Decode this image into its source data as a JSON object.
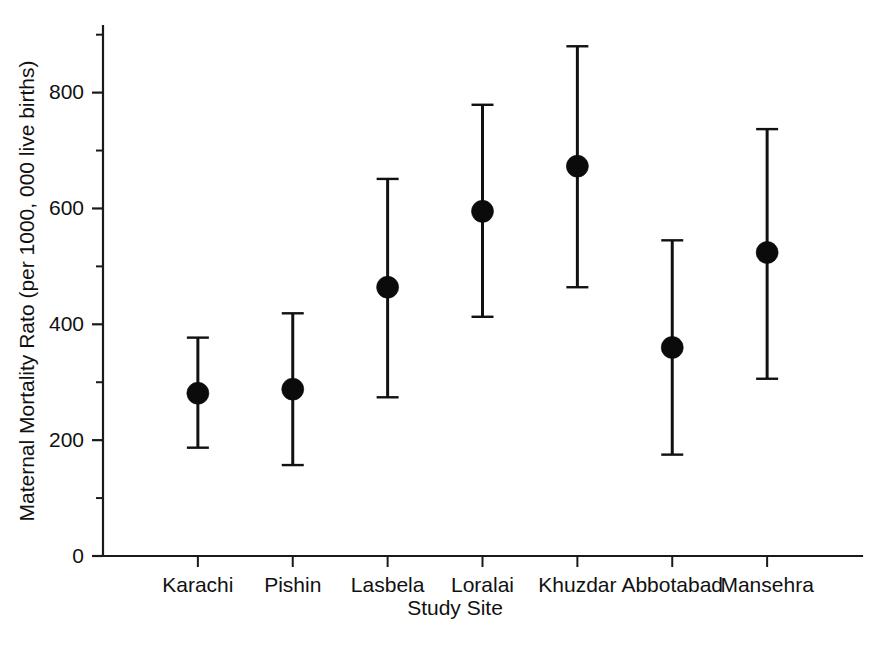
{
  "chart_data": {
    "type": "scatter",
    "title": "",
    "xlabel": "Study Site",
    "ylabel": "Maternal Mortality Rato (per 1000, 000 live births)",
    "categories": [
      "Karachi",
      "Pishin",
      "Lasbela",
      "Loralai",
      "Khuzdar",
      "Abbotabad",
      "Mansehra"
    ],
    "values": [
      281,
      288,
      464,
      595,
      673,
      360,
      524
    ],
    "error_low": [
      187,
      157,
      274,
      413,
      464,
      175,
      306
    ],
    "error_high": [
      377,
      419,
      651,
      779,
      880,
      545,
      737
    ],
    "series": [
      {
        "name": "Maternal Mortality Ratio",
        "points": [
          {
            "category": "Karachi",
            "value": 281,
            "lower": 187,
            "upper": 377
          },
          {
            "category": "Pishin",
            "value": 288,
            "lower": 157,
            "upper": 419
          },
          {
            "category": "Lasbela",
            "value": 464,
            "lower": 274,
            "upper": 651
          },
          {
            "category": "Loralai",
            "value": 595,
            "lower": 413,
            "upper": 779
          },
          {
            "category": "Khuzdar",
            "value": 673,
            "lower": 464,
            "upper": 880
          },
          {
            "category": "Abbotabad",
            "value": 360,
            "lower": 175,
            "upper": 545
          },
          {
            "category": "Mansehra",
            "value": 524,
            "lower": 306,
            "upper": 737
          }
        ]
      }
    ],
    "ylim": [
      0,
      915
    ],
    "xlim": [
      0,
      8
    ],
    "ytick_major": [
      0,
      200,
      400,
      600,
      800
    ],
    "ytick_minor": [
      100,
      300,
      500,
      700,
      900
    ],
    "ytick_labels": [
      "0",
      "200",
      "400",
      "600",
      "800"
    ],
    "grid": false,
    "legend": false,
    "legend_position": "none",
    "marker": "filled-circle",
    "marker_color": "#0b0b0b",
    "errorbar_color": "#111111",
    "background_color": "#ffffff",
    "axis_color": "#1a1a1a"
  }
}
